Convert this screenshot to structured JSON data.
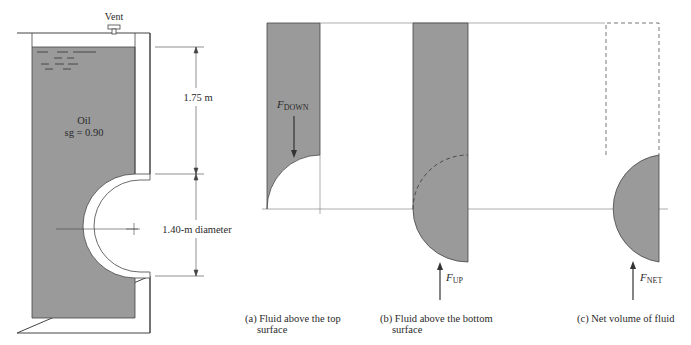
{
  "tank": {
    "vent_label": "Vent",
    "fluid_name": "Oil",
    "fluid_sg": "sg = 0.90",
    "depth_label": "1.75 m",
    "diameter_label": "1.40-m diameter"
  },
  "panels": [
    {
      "id": "a",
      "force_label_main": "F",
      "force_label_sub": "DOWN",
      "caption_line1": "(a) Fluid above the top",
      "caption_line2": "surface"
    },
    {
      "id": "b",
      "force_label_main": "F",
      "force_label_sub": "UP",
      "caption_line1": "(b) Fluid above the bottom",
      "caption_line2": "surface"
    },
    {
      "id": "c",
      "force_label_main": "F",
      "force_label_sub": "NET",
      "caption_line1": "(c) Net volume of fluid",
      "caption_line2": ""
    }
  ],
  "colors": {
    "fluid": "#9a9a9a",
    "line": "#444444",
    "wall": "#ffffff"
  }
}
